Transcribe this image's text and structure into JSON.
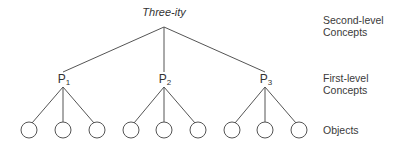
{
  "diagram": {
    "root": {
      "label": "Three-ity"
    },
    "first_level": [
      {
        "prefix": "P",
        "sub": "1"
      },
      {
        "prefix": "P",
        "sub": "2"
      },
      {
        "prefix": "P",
        "sub": "3"
      }
    ],
    "objects_per_concept": 3,
    "levels": [
      {
        "line1": "Second-level",
        "line2": "Concepts"
      },
      {
        "line1": "First-level",
        "line2": "Concepts"
      },
      {
        "line1": "Objects"
      }
    ]
  }
}
